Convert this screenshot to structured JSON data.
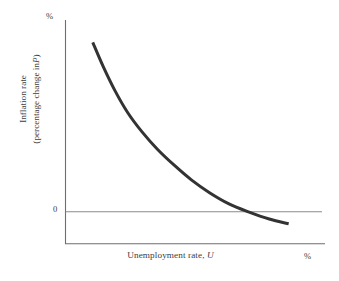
{
  "figure": {
    "background_color": "#ffffff",
    "axis_color": "#6e6e6e",
    "zero_line_color": "#8a8a8a",
    "curve_color": "#333333",
    "text_color": "#3d3d3d"
  },
  "labels": {
    "y_axis_unit": "%",
    "x_axis_unit": "%",
    "zero_tick": "0",
    "x_axis_title_main": "Unemployment rate,",
    "x_axis_title_var": "U",
    "y_axis_title_line1": "Inflation rate",
    "y_axis_title_line2_prefix": "(percentage change in",
    "y_axis_title_line2_var": "P",
    "y_axis_title_line2_suffix": ")"
  },
  "chart_data": {
    "type": "line",
    "title": "",
    "xlabel": "Unemployment rate, U",
    "ylabel": "Inflation rate (percentage change in P)",
    "x_unit": "%",
    "y_unit": "%",
    "grid": false,
    "legend": null,
    "axis_ranges": {
      "x": [
        0,
        10
      ],
      "y": [
        -2,
        12
      ]
    },
    "tick_labels": {
      "x": [],
      "y": [
        "0"
      ]
    },
    "annotations": [
      {
        "text": "%",
        "position": "y-axis-top"
      },
      {
        "text": "%",
        "position": "x-axis-right"
      }
    ],
    "series": [
      {
        "name": "Phillips curve",
        "color": "#333333",
        "line_width": 3,
        "x": [
          1.05,
          1.45,
          1.9,
          2.4,
          2.95,
          3.55,
          4.2,
          4.85,
          5.55,
          6.3,
          7.05,
          7.85,
          8.6
        ],
        "y": [
          10.6,
          9.1,
          7.6,
          6.2,
          5.0,
          3.9,
          2.9,
          2.0,
          1.2,
          0.5,
          0.0,
          -0.45,
          -0.75
        ],
        "zero_crossing_x": 7.05,
        "description": "Downward-sloping convex Phillips curve: inflation falls steeply as unemployment rises, then flattens and becomes slightly negative."
      }
    ]
  }
}
